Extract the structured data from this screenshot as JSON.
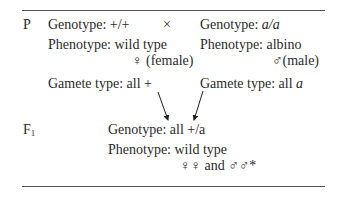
{
  "parental": {
    "label": "P",
    "cross_symbol": "×",
    "female": {
      "genotype_label": "Genotype:",
      "genotype": "+/+",
      "phenotype_label": "Phenotype:",
      "phenotype": "wild type",
      "sex_symbol": "♀",
      "sex": "(female)",
      "gamete_label": "Gamete type: all",
      "gamete": "+"
    },
    "male": {
      "genotype_label": "Genotype:",
      "genotype": "a/a",
      "phenotype_label": "Phenotype:",
      "phenotype": "albino",
      "sex_symbol": "♂",
      "sex": "(male)",
      "gamete_label": "Gamete type: all",
      "gamete": "a"
    }
  },
  "f1": {
    "label": "F",
    "label_sub": "1",
    "genotype_label": "Genotype: all",
    "genotype": "+/a",
    "phenotype_label": "Phenotype:",
    "phenotype": "wild type",
    "sexes": "♀♀ and ♂♂*"
  }
}
